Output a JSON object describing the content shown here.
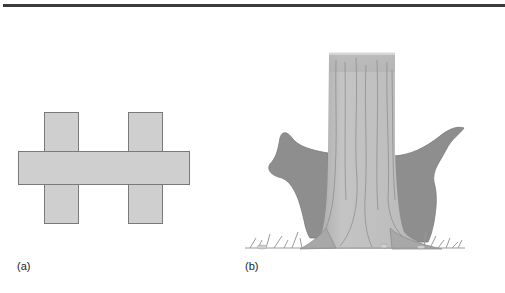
{
  "figure": {
    "top_rule": true,
    "panels": [
      {
        "id": "a",
        "label": "(a)",
        "description": "Schematic of a horizontal bar crossing two vertical posts",
        "shapes": {
          "horizontal_bar": {
            "x": 18,
            "y": 151,
            "w": 171,
            "h": 34
          },
          "left_post": {
            "x": 44,
            "y": 112,
            "w": 34,
            "h": 112
          },
          "right_post": {
            "x": 128,
            "y": 112,
            "w": 34,
            "h": 112
          }
        },
        "colors": {
          "fill": "#cfcfcf",
          "stroke": "#7a7a7a"
        }
      },
      {
        "id": "b",
        "label": "(b)",
        "description": "Illustration of a tree trunk with buttress roots and grass at the base",
        "colors": {
          "trunk": "#b9b9b9",
          "bark_lines": "#8a8a8a",
          "buttress": "#8e8e8e",
          "grass": "#9a9a9a"
        }
      }
    ]
  }
}
